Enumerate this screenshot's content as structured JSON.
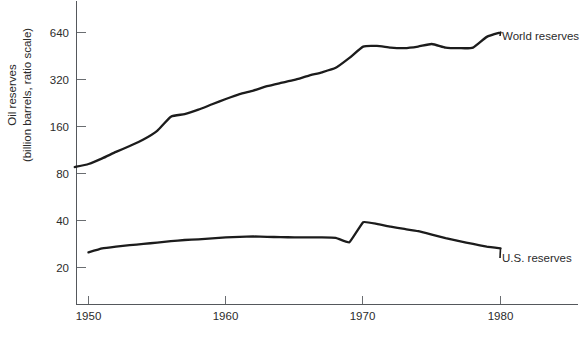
{
  "chart_data": {
    "type": "line",
    "title": "",
    "subtitle": "",
    "xlabel": "",
    "ylabel": "Oil reserves",
    "ylabel_line2": "(billion barrels, ratio scale)",
    "yscale": "log",
    "y_base": 2,
    "ylim": [
      14,
      900
    ],
    "xlim": [
      1948.2,
      1986.5
    ],
    "grid": false,
    "legend_position": "inline-right",
    "y_ticks": [
      20,
      40,
      80,
      160,
      320,
      640
    ],
    "y_tick_labels": [
      "20",
      "40",
      "80",
      "160",
      "320",
      "640"
    ],
    "x_ticks": [
      1950,
      1960,
      1970,
      1980
    ],
    "x_tick_labels": [
      "1950",
      "1960",
      "1970",
      "1980"
    ],
    "annotations": [],
    "series": [
      {
        "name": "World reserves",
        "label": "World reserves",
        "color": "#1c1c1c",
        "x": [
          1949,
          1950,
          1951,
          1952,
          1953,
          1954,
          1955,
          1956,
          1957,
          1958,
          1959,
          1960,
          1961,
          1962,
          1963,
          1964,
          1965,
          1966,
          1967,
          1968,
          1969,
          1970,
          1971,
          1972,
          1973,
          1974,
          1975,
          1976,
          1977,
          1978,
          1979,
          1980
        ],
        "values": [
          88,
          92,
          100,
          110,
          120,
          132,
          150,
          185,
          192,
          205,
          222,
          240,
          258,
          272,
          290,
          304,
          318,
          338,
          356,
          380,
          440,
          520,
          525,
          512,
          508,
          520,
          540,
          512,
          508,
          512,
          600,
          640
        ]
      },
      {
        "name": "U.S. reserves",
        "label": "U.S. reserves",
        "color": "#1c1c1c",
        "x": [
          1950,
          1951,
          1952,
          1953,
          1954,
          1955,
          1956,
          1957,
          1958,
          1959,
          1960,
          1961,
          1962,
          1963,
          1964,
          1965,
          1966,
          1967,
          1968,
          1969,
          1970,
          1971,
          1972,
          1973,
          1974,
          1975,
          1976,
          1977,
          1978,
          1979,
          1980
        ],
        "values": [
          25.0,
          26.5,
          27.2,
          27.8,
          28.3,
          28.9,
          29.5,
          30.0,
          30.3,
          30.7,
          31.2,
          31.4,
          31.6,
          31.4,
          31.3,
          31.2,
          31.2,
          31.2,
          31.0,
          29.0,
          39.0,
          38.0,
          36.5,
          35.3,
          34.2,
          32.5,
          30.8,
          29.5,
          28.3,
          27.2,
          26.5
        ]
      }
    ]
  },
  "axis": {
    "y_label_top": "Oil reserves",
    "y_label_bottom": "(billion barrels, ratio scale)"
  },
  "labels": {
    "world": "World reserves",
    "us": "U.S. reserves"
  },
  "ticks": {
    "y": [
      "640",
      "320",
      "160",
      "80",
      "40",
      "20"
    ],
    "x": [
      "1950",
      "1960",
      "1970",
      "1980"
    ]
  },
  "colors": {
    "line": "#1c1c1c",
    "axis": "#55585c",
    "text": "#2b2b2b",
    "background": "#ffffff"
  }
}
